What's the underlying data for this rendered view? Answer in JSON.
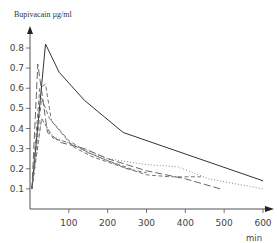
{
  "chart_data": {
    "type": "line",
    "title": "",
    "ylabel": "Bupivacain µg/ml",
    "xlabel": "min",
    "xlim": [
      0,
      620
    ],
    "ylim": [
      0,
      0.85
    ],
    "grid": false,
    "legend": null,
    "x_ticks": [
      100,
      200,
      300,
      400,
      500,
      600
    ],
    "y_ticks": [
      0.1,
      0.2,
      0.3,
      0.4,
      0.5,
      0.6,
      0.7,
      0.8
    ],
    "series": [
      {
        "name": "solid",
        "style": "solid",
        "x": [
          5,
          40,
          75,
          140,
          240,
          600
        ],
        "y": [
          0.1,
          0.82,
          0.68,
          0.54,
          0.38,
          0.14
        ]
      },
      {
        "name": "dotted",
        "style": "dotted",
        "x": [
          5,
          30,
          60,
          120,
          200,
          300,
          380,
          460,
          600
        ],
        "y": [
          0.1,
          0.45,
          0.36,
          0.31,
          0.25,
          0.22,
          0.21,
          0.15,
          0.1
        ]
      },
      {
        "name": "long-dash",
        "style": "long-dash",
        "x": [
          5,
          20,
          45,
          80,
          140,
          200,
          300,
          400,
          490
        ],
        "y": [
          0.1,
          0.72,
          0.38,
          0.33,
          0.3,
          0.25,
          0.19,
          0.15,
          0.1
        ]
      },
      {
        "name": "dash-a",
        "style": "dash",
        "x": [
          5,
          30,
          50,
          110,
          160,
          220,
          300,
          360,
          440
        ],
        "y": [
          0.1,
          0.55,
          0.45,
          0.31,
          0.26,
          0.22,
          0.17,
          0.16,
          0.16
        ]
      },
      {
        "name": "dash-b",
        "style": "dash",
        "x": [
          5,
          25,
          40,
          55,
          100,
          150,
          200,
          250,
          300
        ],
        "y": [
          0.1,
          0.6,
          0.62,
          0.44,
          0.34,
          0.28,
          0.24,
          0.2,
          0.18
        ]
      },
      {
        "name": "dash-c",
        "style": "dash",
        "x": [
          5,
          30,
          60,
          100,
          150,
          200,
          260
        ],
        "y": [
          0.1,
          0.45,
          0.35,
          0.33,
          0.28,
          0.24,
          0.2
        ]
      }
    ]
  },
  "labels": {
    "y_title": "Bupivacain µg/ml",
    "x_unit": "min",
    "y_ticks": [
      "0.1",
      "0.2",
      "0.3",
      "0.4",
      "0.5",
      "0.6",
      "0.7",
      "0.8"
    ],
    "x_ticks": [
      "100",
      "200",
      "300",
      "400",
      "500",
      "600"
    ]
  }
}
